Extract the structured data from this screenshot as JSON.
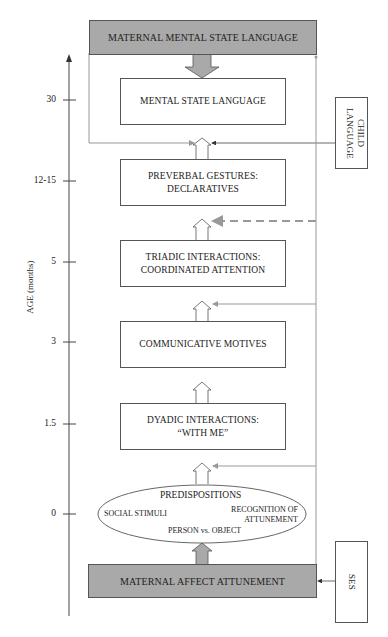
{
  "diagram": {
    "top_box": "MATERNAL MENTAL STATE LANGUAGE",
    "bottom_box": "MATERNAL AFFECT ATTUNEMENT",
    "stages": [
      {
        "line1": "MENTAL STATE LANGUAGE",
        "line2": ""
      },
      {
        "line1": "PREVERBAL GESTURES:",
        "line2": "DECLARATIVES"
      },
      {
        "line1": "TRIADIC INTERACTIONS:",
        "line2": "COORDINATED ATTENTION"
      },
      {
        "line1": "COMMUNICATIVE MOTIVES",
        "line2": ""
      },
      {
        "line1": "DYADIC INTERACTIONS:",
        "line2": "“WITH ME”"
      }
    ],
    "predispositions": {
      "title": "PREDISPOSITIONS",
      "left": "SOCIAL STIMULI",
      "right_line1": "RECOGNITION OF",
      "right_line2": "ATTUNEMENT",
      "bottom": "PERSON vs. OBJECT"
    },
    "side_boxes": {
      "child_language": "CHILD LANGUAGE",
      "ses": "SES"
    },
    "axis": {
      "label": "AGE (months)",
      "ticks": [
        "30",
        "12-15",
        "5",
        "3",
        "1.5",
        "0"
      ]
    },
    "colors": {
      "gray_box": "#a9a9a9",
      "connector_gray": "#999999",
      "dashed": "#999999",
      "line": "#555555"
    }
  }
}
